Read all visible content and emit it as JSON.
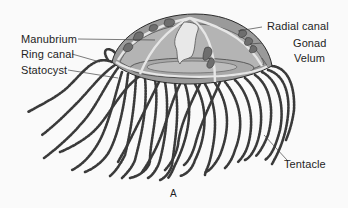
{
  "figure": {
    "panel_label": "A",
    "labels": {
      "manubrium": "Manubrium",
      "ring_canal": "Ring canal",
      "statocyst": "Statocyst",
      "radial_canal": "Radial canal",
      "gonad": "Gonad",
      "velum": "Velum",
      "tentacle": "Tentacle"
    },
    "colors": {
      "background": "#fafafa",
      "bell_fill": "#9a9a9a",
      "bell_inner": "#b4b4b4",
      "gonad": "#6e6e6e",
      "canal": "#e6e6e6",
      "outline": "#2a2a2a",
      "tentacle": "#3a3a3a",
      "text": "#1e1e1e"
    }
  }
}
